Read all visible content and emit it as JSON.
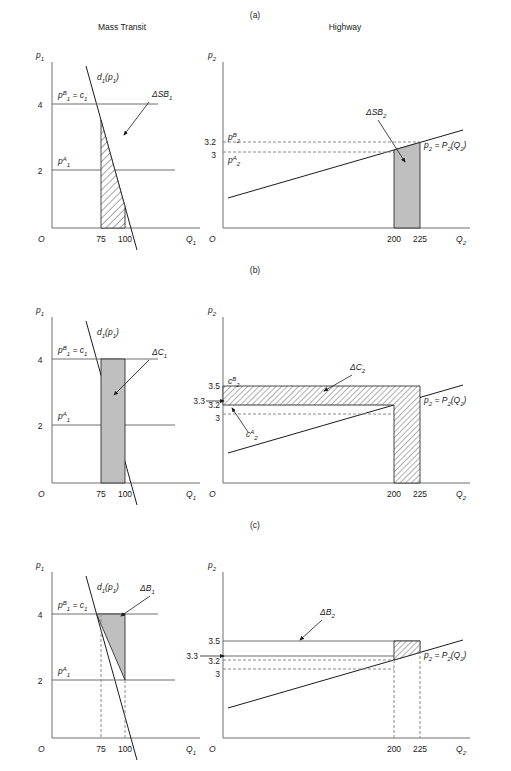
{
  "figure": {
    "panels": [
      {
        "key": "a",
        "letter": "(a)",
        "left_title": "Mass Transit",
        "right_title": "Highway",
        "left": {
          "y_axis_label": "p",
          "y_axis_sub": "1",
          "x_axis_label": "Q",
          "x_axis_sub": "1",
          "origin_label": "O",
          "curve_label": "d",
          "curve_label_sub": "1",
          "curve_label_arg": "(p",
          "curve_label_arg_sub": "1",
          "curve_label_close": ")",
          "y_ticks": [
            "4",
            "2"
          ],
          "x_ticks": [
            "75",
            "100"
          ],
          "price_b_label": "p",
          "price_b_sup": "B",
          "price_b_sub": "1",
          "price_b_eq": "= c",
          "price_b_eq_sub": "1",
          "price_a_label": "p",
          "price_a_sup": "A",
          "price_a_sub": "1",
          "region_label": "ΔSB",
          "region_label_sub": "1",
          "region_fill": "hatch"
        },
        "right": {
          "y_axis_label": "p",
          "y_axis_sub": "2",
          "x_axis_label": "Q",
          "x_axis_sub": "2",
          "origin_label": "O",
          "curve_label": "p",
          "curve_label_sub": "2",
          "curve_label_eq": "= P",
          "curve_label_eq_sub": "2",
          "curve_label_arg": "(Q",
          "curve_label_arg_sub": "2",
          "curve_label_close": ")",
          "y_ticks": [
            "3.2",
            "3"
          ],
          "x_ticks": [
            "200",
            "225"
          ],
          "price_b_label": "p",
          "price_b_sup": "B",
          "price_b_sub": "2",
          "price_a_label": "p",
          "price_a_sup": "A",
          "price_a_sub": "2",
          "region_label": "ΔSB",
          "region_label_sub": "2",
          "region_fill": "solid"
        }
      },
      {
        "key": "b",
        "letter": "(b)",
        "left_title": "",
        "right_title": "",
        "left": {
          "y_axis_label": "p",
          "y_axis_sub": "1",
          "x_axis_label": "Q",
          "x_axis_sub": "1",
          "origin_label": "O",
          "curve_label": "d",
          "curve_label_sub": "1",
          "curve_label_arg": "(p",
          "curve_label_arg_sub": "1",
          "curve_label_close": ")",
          "y_ticks": [
            "4",
            "2"
          ],
          "x_ticks": [
            "75",
            "100"
          ],
          "price_b_label": "p",
          "price_b_sup": "B",
          "price_b_sub": "1",
          "price_b_eq": "= c",
          "price_b_eq_sub": "1",
          "price_a_label": "p",
          "price_a_sup": "A",
          "price_a_sub": "1",
          "region_label": "ΔC",
          "region_label_sub": "1",
          "region_fill": "solid"
        },
        "right": {
          "y_axis_label": "p",
          "y_axis_sub": "2",
          "x_axis_label": "Q",
          "x_axis_sub": "2",
          "origin_label": "O",
          "curve_label": "p",
          "curve_label_sub": "2",
          "curve_label_eq": "= P",
          "curve_label_eq_sub": "2",
          "curve_label_arg": "(Q",
          "curve_label_arg_sub": "2",
          "curve_label_close": ")",
          "y_ticks": [
            "3.5",
            "3.3",
            "3.2",
            "3"
          ],
          "x_ticks": [
            "200",
            "225"
          ],
          "cost_b_label": "c",
          "cost_b_sup": "B",
          "cost_b_sub": "2",
          "cost_a_label": "c",
          "cost_a_sup": "A",
          "cost_a_sub": "2",
          "region_label": "ΔC",
          "region_label_sub": "2",
          "region_fill": "hatch"
        }
      },
      {
        "key": "c",
        "letter": "(c)",
        "left_title": "",
        "right_title": "",
        "left": {
          "y_axis_label": "p",
          "y_axis_sub": "1",
          "x_axis_label": "Q",
          "x_axis_sub": "1",
          "origin_label": "O",
          "curve_label": "d",
          "curve_label_sub": "1",
          "curve_label_arg": "(p",
          "curve_label_arg_sub": "1",
          "curve_label_close": ")",
          "y_ticks": [
            "4",
            "2"
          ],
          "x_ticks": [
            "75",
            "100"
          ],
          "price_b_label": "p",
          "price_b_sup": "B",
          "price_b_sub": "1",
          "price_b_eq": "= c",
          "price_b_eq_sub": "1",
          "price_a_label": "p",
          "price_a_sup": "A",
          "price_a_sub": "1",
          "region_label": "ΔB",
          "region_label_sub": "1",
          "region_fill": "solid"
        },
        "right": {
          "y_axis_label": "p",
          "y_axis_sub": "2",
          "x_axis_label": "Q",
          "x_axis_sub": "2",
          "origin_label": "O",
          "curve_label": "p",
          "curve_label_sub": "2",
          "curve_label_eq": "= P",
          "curve_label_eq_sub": "2",
          "curve_label_arg": "(Q",
          "curve_label_arg_sub": "2",
          "curve_label_close": ")",
          "y_ticks": [
            "3.5",
            "3.3",
            "3.2",
            "3"
          ],
          "x_ticks": [
            "200",
            "225"
          ],
          "region_label": "ΔB",
          "region_label_sub": "2",
          "region_fill": "hatch"
        }
      }
    ]
  },
  "chart_data": [
    {
      "type": "line",
      "panel": "a-left",
      "title": "Mass Transit",
      "xlabel": "Q1",
      "ylabel": "p1",
      "series": [
        {
          "name": "d1(p1)",
          "x": [
            60,
            130
          ],
          "y": [
            5.6,
            0.0
          ]
        }
      ],
      "hlines": [
        {
          "label": "p1^B = c1",
          "value": 4
        },
        {
          "label": "p1^A",
          "value": 2
        }
      ],
      "x_ticks": [
        75,
        100
      ],
      "y_ticks": [
        4,
        2
      ],
      "shaded_region": {
        "label": "dSB1",
        "fill": "hatch",
        "x_range": [
          75,
          100
        ],
        "y_top_curve": "d1",
        "y_bottom": 0
      },
      "grid": false
    },
    {
      "type": "line",
      "panel": "a-right",
      "title": "Highway",
      "xlabel": "Q2",
      "ylabel": "p2",
      "series": [
        {
          "name": "p2 = P2(Q2)",
          "x": [
            0,
            260
          ],
          "y": [
            2.1,
            3.55
          ]
        }
      ],
      "hlines": [
        {
          "label": "p2^B",
          "value": 3.2
        },
        {
          "label": "p2^A",
          "value": 3.0
        }
      ],
      "x_ticks": [
        200,
        225
      ],
      "y_ticks": [
        3.2,
        3
      ],
      "shaded_region": {
        "label": "dSB2",
        "fill": "solid",
        "x_range": [
          200,
          225
        ],
        "y_top_curve": "P2",
        "y_bottom": 0
      },
      "grid": false
    },
    {
      "type": "line",
      "panel": "b-left",
      "xlabel": "Q1",
      "ylabel": "p1",
      "series": [
        {
          "name": "d1(p1)",
          "x": [
            60,
            130
          ],
          "y": [
            5.6,
            0.0
          ]
        }
      ],
      "hlines": [
        {
          "label": "p1^B = c1",
          "value": 4
        },
        {
          "label": "p1^A",
          "value": 2
        }
      ],
      "x_ticks": [
        75,
        100
      ],
      "y_ticks": [
        4,
        2
      ],
      "shaded_region": {
        "label": "dC1",
        "fill": "solid",
        "x_range": [
          75,
          100
        ],
        "y_top": 4,
        "y_bottom": 0
      },
      "grid": false
    },
    {
      "type": "line",
      "panel": "b-right",
      "xlabel": "Q2",
      "ylabel": "p2",
      "series": [
        {
          "name": "p2 = P2(Q2)",
          "x": [
            0,
            260
          ],
          "y": [
            2.1,
            3.55
          ]
        }
      ],
      "hlines": [
        {
          "label": "c2^B",
          "value": 3.5
        },
        {
          "label": "c2^A",
          "value": 3.2
        },
        {
          "label": "",
          "value": 3.0
        }
      ],
      "x_ticks": [
        200,
        225
      ],
      "y_ticks": [
        3.5,
        3.3,
        3.2,
        3
      ],
      "shaded_region": {
        "label": "dC2",
        "fill": "hatch",
        "description": "L-shaped band from 0 to 225 between 3.2 and 3.5, plus column 200-225 down to axis"
      },
      "grid": false
    },
    {
      "type": "line",
      "panel": "c-left",
      "xlabel": "Q1",
      "ylabel": "p1",
      "series": [
        {
          "name": "d1(p1)",
          "x": [
            60,
            130
          ],
          "y": [
            5.6,
            0.0
          ]
        }
      ],
      "hlines": [
        {
          "label": "p1^B = c1",
          "value": 4
        },
        {
          "label": "p1^A",
          "value": 2
        }
      ],
      "x_ticks": [
        75,
        100
      ],
      "y_ticks": [
        4,
        2
      ],
      "shaded_region": {
        "label": "dB1",
        "fill": "solid",
        "x_range": [
          75,
          100
        ],
        "y_top": 4,
        "y_bottom_curve": "d1"
      },
      "grid": false
    },
    {
      "type": "line",
      "panel": "c-right",
      "xlabel": "Q2",
      "ylabel": "p2",
      "series": [
        {
          "name": "p2 = P2(Q2)",
          "x": [
            0,
            260
          ],
          "y": [
            2.1,
            3.55
          ]
        }
      ],
      "hlines": [
        {
          "label": "",
          "value": 3.5
        },
        {
          "label": "",
          "value": 3.2
        },
        {
          "label": "",
          "value": 3.0
        }
      ],
      "x_ticks": [
        200,
        225
      ],
      "y_ticks": [
        3.5,
        3.3,
        3.2,
        3
      ],
      "shaded_region": {
        "label": "dB2",
        "fill": "hatch",
        "x_range": [
          200,
          225
        ],
        "y_range": [
          3.2,
          3.5
        ]
      },
      "grid": false
    }
  ]
}
